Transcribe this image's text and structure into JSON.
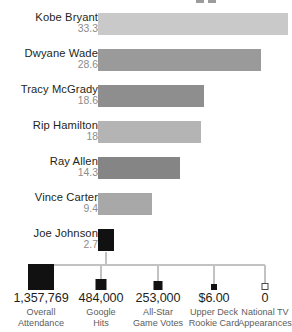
{
  "chart_data": {
    "type": "bar",
    "title": "",
    "subtitle": "",
    "xlabel": "",
    "ylabel": "",
    "orientation": "horizontal",
    "grid": false,
    "legend_position": "bottom",
    "xlim": [
      0,
      33.3
    ],
    "categories": [
      "Kobe Bryant",
      "Dwyane Wade",
      "Tracy McGrady",
      "Rip Hamilton",
      "Ray Allen",
      "Vince Carter",
      "Joe Johnson"
    ],
    "values": [
      33.3,
      28.6,
      18.6,
      18,
      14.3,
      9.4,
      2.7
    ],
    "value_labels": [
      "33.3",
      "28.6",
      "18.6",
      "18",
      "14.3",
      "9.4",
      "2.7"
    ],
    "bar_colors": [
      "#c9c9c9",
      "#9a9a9a",
      "#8e8e8e",
      "#b4b4b4",
      "#858585",
      "#a8a8a8",
      "#111111"
    ],
    "annotations": {
      "type": "size-scaled-squares",
      "series_name": "Joe Johnson metrics",
      "items": [
        {
          "value_label": "1,357,769",
          "description": "Overall Attendance",
          "value": 1357769,
          "filled": true
        },
        {
          "value_label": "484,000",
          "description": "Google Hits",
          "value": 484000,
          "filled": true
        },
        {
          "value_label": "253,000",
          "description": "All-Star Game Votes",
          "value": 253000,
          "filled": true
        },
        {
          "value_label": "$6.00",
          "description": "Upper Deck Rookie Card",
          "value": 6.0,
          "filled": true
        },
        {
          "value_label": "0",
          "description": "National TV Appearances",
          "value": 0,
          "filled": false
        }
      ]
    }
  },
  "bars": [
    {
      "name": "Kobe Bryant",
      "value_label": "33.3",
      "width_px": 190,
      "color": "#c9c9c9",
      "top": 0
    },
    {
      "name": "Dwyane Wade",
      "value_label": "28.6",
      "width_px": 163,
      "color": "#9a9a9a",
      "top": 36
    },
    {
      "name": "Tracy McGrady",
      "value_label": "18.6",
      "width_px": 106,
      "color": "#8e8e8e",
      "top": 72
    },
    {
      "name": "Rip Hamilton",
      "value_label": "18",
      "width_px": 103,
      "color": "#b4b4b4",
      "top": 108
    },
    {
      "name": "Ray Allen",
      "value_label": "14.3",
      "width_px": 82,
      "color": "#858585",
      "top": 144
    },
    {
      "name": "Vince Carter",
      "value_label": "9.4",
      "width_px": 54,
      "color": "#a8a8a8",
      "top": 180
    },
    {
      "name": "Joe Johnson",
      "value_label": "2.7",
      "width_px": 16,
      "color": "#111111",
      "top": 216
    }
  ],
  "legend": {
    "items": [
      {
        "value": "1,357,769",
        "line1": "Overall",
        "line2": "Attendance",
        "size": 26,
        "filled": true,
        "center": 41,
        "width": 82
      },
      {
        "value": "484,000",
        "line1": "Google",
        "line2": "Hits",
        "size": 11,
        "filled": true,
        "center": 101,
        "width": 62
      },
      {
        "value": "253,000",
        "line1": "All-Star",
        "line2": "Game Votes",
        "size": 9,
        "filled": true,
        "center": 158,
        "width": 66
      },
      {
        "value": "$6.00",
        "line1": "Upper Deck",
        "line2": "Rookie Card",
        "size": 6,
        "filled": true,
        "center": 214,
        "width": 68
      },
      {
        "value": "0",
        "line1": "National TV",
        "line2": "Appearances",
        "size": 7,
        "filled": false,
        "center": 265,
        "width": 72
      }
    ]
  }
}
